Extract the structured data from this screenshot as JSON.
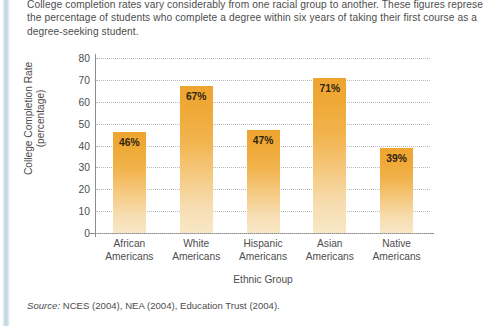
{
  "intro": {
    "line1": "College completion rates vary considerably from one racial group to another. These figures represe",
    "line2": "the percentage of students who complete a degree within six years of taking their first course as a",
    "line3": "degree-seeking student."
  },
  "source": {
    "label": "Source:",
    "text": " NCES (2004), NEA (2004), Education Trust (2004)."
  },
  "colors": {
    "bar_top": "#EFA431",
    "bar_bottom": "#F8E7C6",
    "axis": "#8D8D8D",
    "grid": "#B9B9B9",
    "text": "#4D4D4D",
    "spine": "#BCD4DD"
  },
  "chart_data": {
    "type": "bar",
    "title": "",
    "xlabel": "Ethnic Group",
    "ylabel": "College Completion Rate (percentage)",
    "ylabel_line1": "College Completion Rate",
    "ylabel_line2": "(percentage)",
    "categories": [
      "African Americans",
      "White Americans",
      "Hispanic Americans",
      "Asian Americans",
      "Native Americans"
    ],
    "category_lines": [
      [
        "African",
        "Americans"
      ],
      [
        "White",
        "Americans"
      ],
      [
        "Hispanic",
        "Americans"
      ],
      [
        "Asian",
        "Americans"
      ],
      [
        "Native",
        "Americans"
      ]
    ],
    "values": [
      46,
      67,
      47,
      71,
      39
    ],
    "data_labels": [
      "46%",
      "67%",
      "47%",
      "71%",
      "39%"
    ],
    "ylim": [
      0,
      80
    ],
    "yticks": [
      80,
      70,
      60,
      50,
      40,
      30,
      20,
      10,
      0
    ],
    "ytick_labels": [
      "80",
      "70",
      "60",
      "50",
      "40",
      "30",
      "20",
      "10",
      "0"
    ],
    "grid": true,
    "legend": false
  }
}
